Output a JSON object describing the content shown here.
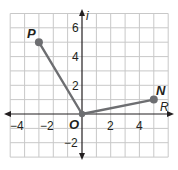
{
  "diagram": {
    "type": "complex-plane",
    "axes": {
      "horizontal_label": "R",
      "vertical_label": "i",
      "origin_label": "O",
      "x_ticks": [
        "−4",
        "−2",
        "2",
        "4"
      ],
      "y_ticks": [
        "6",
        "4",
        "2",
        "−2"
      ],
      "x_range": [
        -5,
        6
      ],
      "y_range": [
        -3,
        7
      ]
    },
    "points": [
      {
        "label": "P",
        "x": -3,
        "y": 5
      },
      {
        "label": "N",
        "x": 5,
        "y": 1
      },
      {
        "label": "O",
        "x": 0,
        "y": 0
      }
    ],
    "segments": [
      {
        "from": "O",
        "to": "P"
      },
      {
        "from": "O",
        "to": "N"
      }
    ],
    "colors": {
      "grid": "#c8c8c8",
      "axis": "#231f20",
      "segment": "#6d6e71",
      "point": "#6d6e71"
    }
  }
}
